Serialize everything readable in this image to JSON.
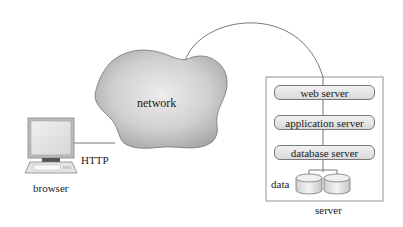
{
  "diagram": {
    "nodes": {
      "network": {
        "label": "network"
      },
      "browser": {
        "label": "browser"
      },
      "protocol": {
        "label": "HTTP"
      },
      "server": {
        "label": "server",
        "tiers": [
          {
            "label": "web server"
          },
          {
            "label": "application server"
          },
          {
            "label": "database server"
          }
        ],
        "storage": {
          "label": "data",
          "disk_count": 2
        }
      }
    },
    "edges": [
      {
        "from": "browser",
        "to": "network",
        "label": "HTTP"
      },
      {
        "from": "network",
        "to": "web server"
      },
      {
        "from": "web server",
        "to": "application server"
      },
      {
        "from": "application server",
        "to": "database server"
      },
      {
        "from": "database server",
        "to": "data"
      }
    ],
    "colors": {
      "cloud_fill_light": "#e6e6e6",
      "cloud_fill_dark": "#a9a9a9",
      "line": "#555555",
      "tier_fill": "#e4e4e4"
    }
  }
}
